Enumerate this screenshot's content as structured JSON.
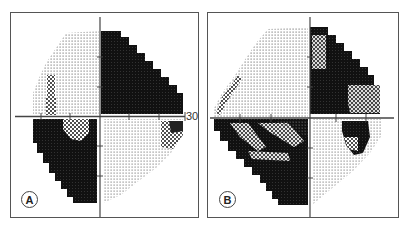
{
  "figure": {
    "panels": [
      {
        "id": "A",
        "label": "A",
        "axis_scale_label": "30"
      },
      {
        "id": "B",
        "label": "B"
      }
    ]
  },
  "colors": {
    "border": "#555555",
    "dense_defect": "#111111",
    "background": "#ffffff",
    "dot": "#555555"
  }
}
